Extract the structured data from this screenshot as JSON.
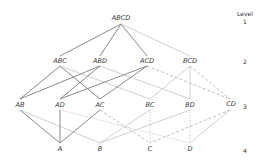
{
  "legend": {
    "title": "Level",
    "levels": [
      "1",
      "2",
      "3",
      "4"
    ]
  },
  "nodes": {
    "ABCD": "ABCD",
    "ABC": "ABC",
    "ABD": "ABD",
    "ACD": "ACD",
    "BCD": "BCD",
    "AB": "AB",
    "AD": "AD",
    "AC": "AC",
    "BC": "BC",
    "BD": "BD",
    "CD": "CD",
    "A": "A",
    "B": "B",
    "C": "C",
    "D": "D"
  },
  "colors": {
    "thick": "#8a8a8a",
    "thin": "#c4c4c4",
    "dashed": "#b0b0b0",
    "dotted": "#b0b0b0"
  }
}
